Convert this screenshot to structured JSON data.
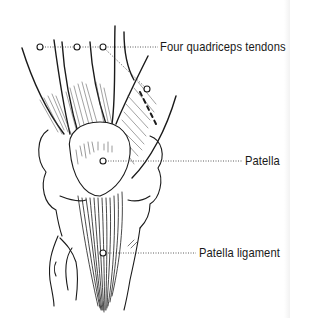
{
  "diagram": {
    "labels": [
      {
        "id": "quadriceps",
        "text": "Four quadriceps tendons"
      },
      {
        "id": "patella",
        "text": "Patella"
      },
      {
        "id": "ligament",
        "text": "Patella ligament"
      }
    ],
    "colors": {
      "ink": "#1a1a1a",
      "background": "#ffffff"
    }
  }
}
